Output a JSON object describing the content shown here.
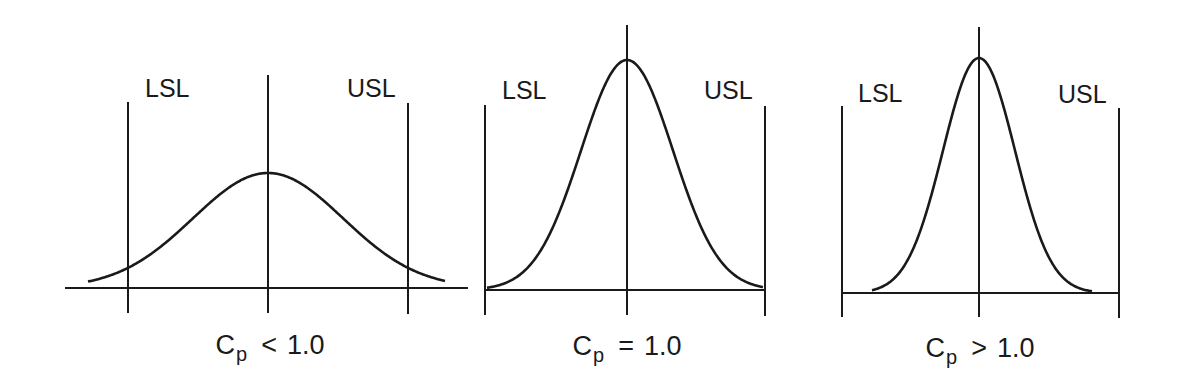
{
  "diagram": {
    "type": "process-capability-comparison",
    "stroke_color": "#1a1a1a",
    "background": "#ffffff",
    "panels": [
      {
        "id": "cp-less",
        "lsl_label": "LSL",
        "usl_label": "USL",
        "caption": {
          "symbol": "C",
          "subscript": "p",
          "operator": "<",
          "value": "1.0"
        },
        "geometry": {
          "baseline_y": 288,
          "baseline_x1": 65,
          "baseline_x2": 468,
          "lsl_x": 128,
          "lsl_top": 102,
          "lsl_bottom": 313,
          "center_x": 268,
          "center_top": 75,
          "center_bottom": 313,
          "usl_x": 408,
          "usl_top": 103,
          "usl_bottom": 314,
          "peak_y": 173,
          "sigma": 75,
          "tail_x1": 88,
          "tail_x2": 445,
          "lsl_label_x": 145,
          "lsl_label_y": 98,
          "usl_label_x": 347,
          "usl_label_y": 98,
          "caption_x": 270,
          "caption_y": 332
        }
      },
      {
        "id": "cp-equal",
        "lsl_label": "LSL",
        "usl_label": "USL",
        "caption": {
          "symbol": "C",
          "subscript": "p",
          "operator": "=",
          "value": "1.0"
        },
        "geometry": {
          "baseline_y": 290,
          "baseline_x1": 485,
          "baseline_x2": 765,
          "lsl_x": 485,
          "lsl_top": 105,
          "lsl_bottom": 315,
          "center_x": 627,
          "center_top": 25,
          "center_bottom": 315,
          "usl_x": 765,
          "usl_top": 106,
          "usl_bottom": 316,
          "peak_y": 60,
          "sigma": 46,
          "tail_x1": 487,
          "tail_x2": 763,
          "lsl_label_x": 502,
          "lsl_label_y": 100,
          "usl_label_x": 704,
          "usl_label_y": 100,
          "caption_x": 627,
          "caption_y": 333
        }
      },
      {
        "id": "cp-greater",
        "lsl_label": "LSL",
        "usl_label": "USL",
        "caption": {
          "symbol": "C",
          "subscript": "p",
          "operator": ">",
          "value": "1.0"
        },
        "geometry": {
          "baseline_y": 293,
          "baseline_x1": 842,
          "baseline_x2": 1119,
          "lsl_x": 842,
          "lsl_top": 106,
          "lsl_bottom": 317,
          "center_x": 979,
          "center_top": 27,
          "center_bottom": 317,
          "usl_x": 1119,
          "usl_top": 108,
          "usl_bottom": 318,
          "peak_y": 58,
          "sigma": 36,
          "tail_x1": 872,
          "tail_x2": 1092,
          "lsl_label_x": 858,
          "lsl_label_y": 103,
          "usl_label_x": 1058,
          "usl_label_y": 104,
          "caption_x": 980,
          "caption_y": 335
        }
      }
    ]
  }
}
